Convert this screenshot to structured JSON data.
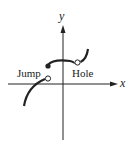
{
  "diagram": {
    "type": "function-graph-discontinuities",
    "axes": {
      "x_label": "x",
      "y_label": "y"
    },
    "annotations": [
      {
        "id": "jump",
        "label": "Jump"
      },
      {
        "id": "hole",
        "label": "Hole"
      }
    ],
    "points": [
      {
        "kind": "closed",
        "meaning": "left end of middle branch"
      },
      {
        "kind": "open",
        "meaning": "right end of left branch (jump)"
      },
      {
        "kind": "open",
        "meaning": "removable discontinuity (hole)"
      }
    ],
    "colors": {
      "stroke": "#222222",
      "background": "#ffffff"
    }
  }
}
